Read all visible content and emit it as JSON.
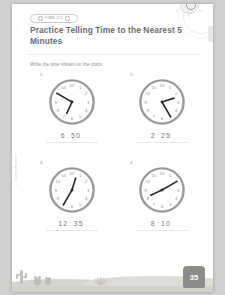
{
  "worksheet": {
    "topic_badge": "TIME (C)",
    "title": "Practice Telling Time to the Nearest 5 Minutes",
    "instruction": "Write the time shown on the clock.",
    "page_number": "35",
    "spine_credit": "© Teaching Resources"
  },
  "problems": [
    {
      "number": "1.",
      "hour": "6",
      "minute": "50",
      "colon": ":",
      "hour_angle": 205,
      "minute_angle": 300
    },
    {
      "number": "2.",
      "hour": "2",
      "minute": "25",
      "colon": ":",
      "hour_angle": 72,
      "minute_angle": 150
    },
    {
      "number": "3.",
      "hour": "12",
      "minute": "35",
      "colon": ":",
      "hour_angle": 17,
      "minute_angle": 210
    },
    {
      "number": "4.",
      "hour": "8",
      "minute": "10",
      "colon": ":",
      "hour_angle": 245,
      "minute_angle": 60
    }
  ],
  "clock_numerals": [
    "12",
    "1",
    "2",
    "3",
    "4",
    "5",
    "6",
    "7",
    "8",
    "9",
    "10",
    "11"
  ],
  "colors": {
    "paper": "#ffffff",
    "ink": "#6e6e6e",
    "rim": "#8f8f8f",
    "sand": "#d6d4cf",
    "badge": "#8e8c88"
  },
  "decor": {
    "sun": "sun-smiling-icon",
    "scene": "desert-scene"
  }
}
